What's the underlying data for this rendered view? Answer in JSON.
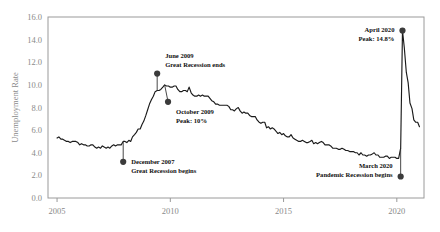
{
  "chart_data": {
    "type": "line",
    "title": "",
    "xlabel": "",
    "ylabel": "Unemployment Rate",
    "xlim": [
      2004.6,
      2021.2
    ],
    "ylim": [
      0.0,
      16.0
    ],
    "grid": false,
    "legend": "none",
    "x_ticks": [
      "2005",
      "2010",
      "2015",
      "2020"
    ],
    "x_tick_values": [
      2005,
      2010,
      2015,
      2020
    ],
    "y_ticks": [
      "0.0",
      "2.0",
      "4.0",
      "6.0",
      "8.0",
      "10.0",
      "12.0",
      "14.0",
      "16.0"
    ],
    "y_tick_values": [
      0.0,
      2.0,
      4.0,
      6.0,
      8.0,
      10.0,
      12.0,
      14.0,
      16.0
    ],
    "series": [
      {
        "name": "Unemployment Rate",
        "x": [
          2005.0,
          2005.08,
          2005.17,
          2005.25,
          2005.33,
          2005.42,
          2005.5,
          2005.58,
          2005.67,
          2005.75,
          2005.83,
          2005.92,
          2006.0,
          2006.08,
          2006.17,
          2006.25,
          2006.33,
          2006.42,
          2006.5,
          2006.58,
          2006.67,
          2006.75,
          2006.83,
          2006.92,
          2007.0,
          2007.08,
          2007.17,
          2007.25,
          2007.33,
          2007.42,
          2007.5,
          2007.58,
          2007.67,
          2007.75,
          2007.83,
          2007.92,
          2008.0,
          2008.08,
          2008.17,
          2008.25,
          2008.33,
          2008.42,
          2008.5,
          2008.58,
          2008.67,
          2008.75,
          2008.83,
          2008.92,
          2009.0,
          2009.08,
          2009.17,
          2009.25,
          2009.33,
          2009.42,
          2009.5,
          2009.58,
          2009.67,
          2009.75,
          2009.83,
          2009.92,
          2010.0,
          2010.08,
          2010.17,
          2010.25,
          2010.33,
          2010.42,
          2010.5,
          2010.58,
          2010.67,
          2010.75,
          2010.83,
          2010.92,
          2011.0,
          2011.08,
          2011.17,
          2011.25,
          2011.33,
          2011.42,
          2011.5,
          2011.58,
          2011.67,
          2011.75,
          2011.83,
          2011.92,
          2012.0,
          2012.08,
          2012.17,
          2012.25,
          2012.33,
          2012.42,
          2012.5,
          2012.58,
          2012.67,
          2012.75,
          2012.83,
          2012.92,
          2013.0,
          2013.08,
          2013.17,
          2013.25,
          2013.33,
          2013.42,
          2013.5,
          2013.58,
          2013.67,
          2013.75,
          2013.83,
          2013.92,
          2014.0,
          2014.08,
          2014.17,
          2014.25,
          2014.33,
          2014.42,
          2014.5,
          2014.58,
          2014.67,
          2014.75,
          2014.83,
          2014.92,
          2015.0,
          2015.08,
          2015.17,
          2015.25,
          2015.33,
          2015.42,
          2015.5,
          2015.58,
          2015.67,
          2015.75,
          2015.83,
          2015.92,
          2016.0,
          2016.08,
          2016.17,
          2016.25,
          2016.33,
          2016.42,
          2016.5,
          2016.58,
          2016.67,
          2016.75,
          2016.83,
          2016.92,
          2017.0,
          2017.08,
          2017.17,
          2017.25,
          2017.33,
          2017.42,
          2017.5,
          2017.58,
          2017.67,
          2017.75,
          2017.83,
          2017.92,
          2018.0,
          2018.08,
          2018.17,
          2018.25,
          2018.33,
          2018.42,
          2018.5,
          2018.58,
          2018.67,
          2018.75,
          2018.83,
          2018.92,
          2019.0,
          2019.08,
          2019.17,
          2019.25,
          2019.33,
          2019.42,
          2019.5,
          2019.58,
          2019.67,
          2019.75,
          2019.83,
          2019.92,
          2020.0,
          2020.08,
          2020.17,
          2020.25,
          2020.33,
          2020.42,
          2020.5,
          2020.58,
          2020.67,
          2020.75,
          2020.83,
          2020.92,
          2021.0
        ],
        "values": [
          5.3,
          5.4,
          5.2,
          5.2,
          5.1,
          5.0,
          5.0,
          4.9,
          5.0,
          5.0,
          5.0,
          4.9,
          4.7,
          4.8,
          4.7,
          4.7,
          4.6,
          4.6,
          4.7,
          4.7,
          4.5,
          4.4,
          4.5,
          4.4,
          4.6,
          4.5,
          4.4,
          4.5,
          4.4,
          4.6,
          4.7,
          4.6,
          4.7,
          4.7,
          4.7,
          5.0,
          5.0,
          4.9,
          5.1,
          5.0,
          5.4,
          5.6,
          5.8,
          6.1,
          6.1,
          6.5,
          6.8,
          7.3,
          7.8,
          8.3,
          8.7,
          9.0,
          9.4,
          9.5,
          9.5,
          9.6,
          9.8,
          10.0,
          9.9,
          9.9,
          9.8,
          9.8,
          9.9,
          9.9,
          9.6,
          9.4,
          9.4,
          9.5,
          9.5,
          9.4,
          9.8,
          9.3,
          9.1,
          9.0,
          9.0,
          9.1,
          9.0,
          9.1,
          9.0,
          9.0,
          9.0,
          8.8,
          8.6,
          8.5,
          8.3,
          8.3,
          8.2,
          8.2,
          8.2,
          8.2,
          8.2,
          8.1,
          7.8,
          7.8,
          7.7,
          7.9,
          8.0,
          7.7,
          7.5,
          7.6,
          7.5,
          7.5,
          7.3,
          7.2,
          7.2,
          7.2,
          6.9,
          6.7,
          6.6,
          6.7,
          6.7,
          6.2,
          6.3,
          6.1,
          6.2,
          6.1,
          5.9,
          5.7,
          5.8,
          5.6,
          5.7,
          5.5,
          5.4,
          5.4,
          5.6,
          5.3,
          5.2,
          5.1,
          5.0,
          5.0,
          5.1,
          5.0,
          4.9,
          4.9,
          5.0,
          5.1,
          4.8,
          4.9,
          4.8,
          4.9,
          5.0,
          4.9,
          4.7,
          4.7,
          4.7,
          4.6,
          4.4,
          4.4,
          4.4,
          4.3,
          4.3,
          4.4,
          4.3,
          4.2,
          4.2,
          4.1,
          4.1,
          4.1,
          4.0,
          4.0,
          3.8,
          4.0,
          3.8,
          3.8,
          3.7,
          3.8,
          3.8,
          3.9,
          4.0,
          3.8,
          3.8,
          3.6,
          3.6,
          3.6,
          3.7,
          3.7,
          3.5,
          3.6,
          3.6,
          3.6,
          3.5,
          3.5,
          4.4,
          14.8,
          13.3,
          11.1,
          10.2,
          8.4,
          7.9,
          6.9,
          6.7,
          6.7,
          6.3
        ]
      }
    ],
    "annotations": [
      {
        "id": "great-recession-ends",
        "line1": "June 2009",
        "line2": "Great Recession ends",
        "point_x": 2009.42,
        "point_y": 9.5,
        "marker_x": 2009.42,
        "marker_y": 11.0,
        "text_anchor": "start"
      },
      {
        "id": "october-2009-peak",
        "line1": "October 2009",
        "line2": "Peak: 10%",
        "point_x": 2009.75,
        "point_y": 10.0,
        "marker_x": 2009.9,
        "marker_y": 8.5,
        "text_anchor": "start"
      },
      {
        "id": "great-recession-begins",
        "line1": "December 2007",
        "line2": "Great Recession begins",
        "point_x": 2007.92,
        "point_y": 5.0,
        "marker_x": 2007.92,
        "marker_y": 3.2,
        "text_anchor": "start"
      },
      {
        "id": "april-2020-peak",
        "line1": "April 2020",
        "line2": "Peak: 14.8%",
        "point_x": 2020.25,
        "point_y": 14.8,
        "marker_x": 2020.25,
        "marker_y": 14.8,
        "text_anchor": "end"
      },
      {
        "id": "pandemic-recession-begins",
        "line1": "March 2020",
        "line2": "Pandemic Recession begins",
        "point_x": 2020.17,
        "point_y": 4.4,
        "marker_x": 2020.17,
        "marker_y": 1.9,
        "text_anchor": "end"
      }
    ],
    "colors": {
      "line": "#1a1a1a",
      "marker": "#3b3b3b",
      "frame": "#9a9a9a",
      "tick_text": "#8a8a8a",
      "annotation_text": "#111111",
      "background": "#ffffff"
    }
  }
}
